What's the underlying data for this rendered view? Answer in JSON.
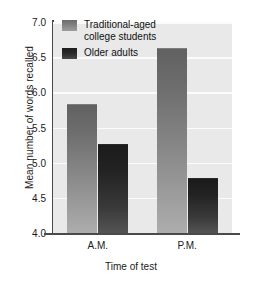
{
  "chart_data": {
    "type": "bar",
    "title": "",
    "xlabel": "Time of test",
    "ylabel": "Mean number of words recalled",
    "categories": [
      "A.M.",
      "P.M."
    ],
    "series": [
      {
        "name": "Traditional-aged\ncollege students",
        "values": [
          5.83,
          6.63
        ],
        "color": "#8e8e8e"
      },
      {
        "name": "Older adults",
        "values": [
          5.26,
          4.78
        ],
        "color": "#2a2a2a"
      }
    ],
    "ylim": [
      4.0,
      7.0
    ],
    "yticks": [
      "4.0",
      "4.5",
      "5.0",
      "5.5",
      "6.0",
      "6.5",
      "7.0"
    ],
    "ytick_values": [
      4.0,
      4.5,
      5.0,
      5.5,
      6.0,
      6.5,
      7.0
    ],
    "grid": true,
    "legend_position": "top-left-inside",
    "plot_background": "#e9e9e9",
    "gridline_color": "#fbfbfb"
  },
  "axis": {
    "y_title": "Mean number of words recalled",
    "x_title": "Time of test"
  },
  "legend": {
    "entries": [
      {
        "label": "Traditional-aged\ncollege students"
      },
      {
        "label": "Older adults"
      }
    ]
  }
}
